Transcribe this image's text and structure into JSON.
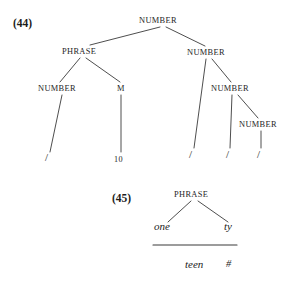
{
  "figure": {
    "caption_top": "(44)",
    "caption_bottom": "(45)"
  },
  "tree_44": {
    "nodes": {
      "root": "NUMBER",
      "phrase": "PHRASE",
      "right_number": "NUMBER",
      "left_number": "NUMBER",
      "m_node": "M",
      "mid_number": "NUMBER",
      "inner_number": "NUMBER"
    },
    "terminals": {
      "slash_1": "/",
      "ten": "10",
      "slash_2": "/",
      "slash_3": "/",
      "slash_4": "/"
    }
  },
  "tree_45": {
    "nodes": {
      "phrase": "PHRASE"
    },
    "morphemes": {
      "left": "one",
      "right": "ty",
      "fused": "teen",
      "boundary": "#"
    }
  },
  "colors": {
    "ink": "#262626",
    "background": "#ffffff",
    "line": "#3a3a3a"
  }
}
